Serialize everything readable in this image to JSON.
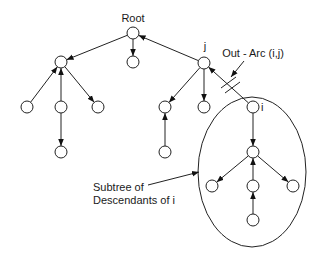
{
  "diagram": {
    "labels": {
      "root": "Root",
      "j": "j",
      "i": "i",
      "out_arc": "Out - Arc (i,j)",
      "subtree_line1": "Subtree of",
      "subtree_line2": "Descendants of i"
    },
    "nodes": [
      {
        "id": "root",
        "x": 133,
        "y": 33
      },
      {
        "id": "a",
        "x": 61,
        "y": 62
      },
      {
        "id": "b",
        "x": 133,
        "y": 62
      },
      {
        "id": "j",
        "x": 204,
        "y": 63
      },
      {
        "id": "a1",
        "x": 27,
        "y": 107
      },
      {
        "id": "a2",
        "x": 61,
        "y": 107
      },
      {
        "id": "a3",
        "x": 98,
        "y": 107
      },
      {
        "id": "j1",
        "x": 165,
        "y": 107
      },
      {
        "id": "j2",
        "x": 204,
        "y": 107
      },
      {
        "id": "i",
        "x": 253,
        "y": 107
      },
      {
        "id": "a2c",
        "x": 61,
        "y": 152
      },
      {
        "id": "j1c",
        "x": 165,
        "y": 152
      },
      {
        "id": "m",
        "x": 253,
        "y": 152
      },
      {
        "id": "m1",
        "x": 212,
        "y": 186
      },
      {
        "id": "m2",
        "x": 253,
        "y": 186
      },
      {
        "id": "m3",
        "x": 293,
        "y": 186
      },
      {
        "id": "m2c",
        "x": 253,
        "y": 220
      }
    ],
    "edges": [
      {
        "from": "root",
        "to": "a"
      },
      {
        "from": "root",
        "to": "b"
      },
      {
        "from": "j",
        "to": "root"
      },
      {
        "from": "a1",
        "to": "a"
      },
      {
        "from": "a2",
        "to": "a"
      },
      {
        "from": "a",
        "to": "a3"
      },
      {
        "from": "a2",
        "to": "a2c"
      },
      {
        "from": "j",
        "to": "j1"
      },
      {
        "from": "j",
        "to": "j2"
      },
      {
        "from": "i",
        "to": "j",
        "cut": true
      },
      {
        "from": "j1c",
        "to": "j1"
      },
      {
        "from": "i",
        "to": "m"
      },
      {
        "from": "m",
        "to": "m1"
      },
      {
        "from": "m2",
        "to": "m"
      },
      {
        "from": "m",
        "to": "m3"
      },
      {
        "from": "m2c",
        "to": "m2"
      }
    ],
    "subtree_ellipse": {
      "cx": 252,
      "cy": 172,
      "rx": 54,
      "ry": 75
    },
    "colors": {
      "stroke": "#222222",
      "background": "#ffffff"
    }
  }
}
